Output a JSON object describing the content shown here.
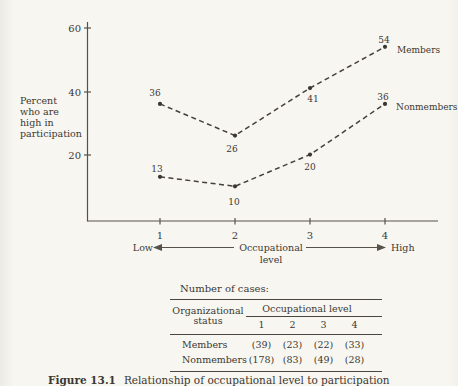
{
  "colors": {
    "paper": "#f8f6f1",
    "ink": "#3b3833",
    "line": "#56524a"
  },
  "chart_data": {
    "type": "line",
    "x": [
      1,
      2,
      3,
      4
    ],
    "x_tick_labels": [
      "1",
      "2",
      "3",
      "4"
    ],
    "series": [
      {
        "name": "Members",
        "values": [
          36,
          26,
          41,
          54
        ]
      },
      {
        "name": "Nonmembers",
        "values": [
          13,
          10,
          20,
          36
        ]
      }
    ],
    "ylabel": "Percent who are high in participation",
    "ylabel_lines": [
      "Percent",
      "who are",
      "high in",
      "participation"
    ],
    "yticks": [
      20,
      40,
      60
    ],
    "ytick_labels": [
      "20",
      "40",
      "60"
    ],
    "ylim": [
      0,
      63
    ],
    "xlabel": "Occupational level",
    "xlabel_line1": "Occupational",
    "xlabel_line2": "level",
    "x_left_label": "Low",
    "x_right_label": "High",
    "line_style": "dashed",
    "legend_position": "right-of-last-point",
    "grid": false
  },
  "table": {
    "title": "Number of cases:",
    "row_header_line1": "Organizational",
    "row_header_line2": "status",
    "col_group_header": "Occupational level",
    "columns": [
      "1",
      "2",
      "3",
      "4"
    ],
    "rows": [
      {
        "label": "Members",
        "cells": [
          "(39)",
          "(23)",
          "(22)",
          "(33)"
        ]
      },
      {
        "label": "Nonmembers",
        "cells": [
          "(178)",
          "(83)",
          "(49)",
          "(28)"
        ]
      }
    ]
  },
  "caption": {
    "label": "Figure 13.1",
    "text": "Relationship of occupational level to participation"
  }
}
